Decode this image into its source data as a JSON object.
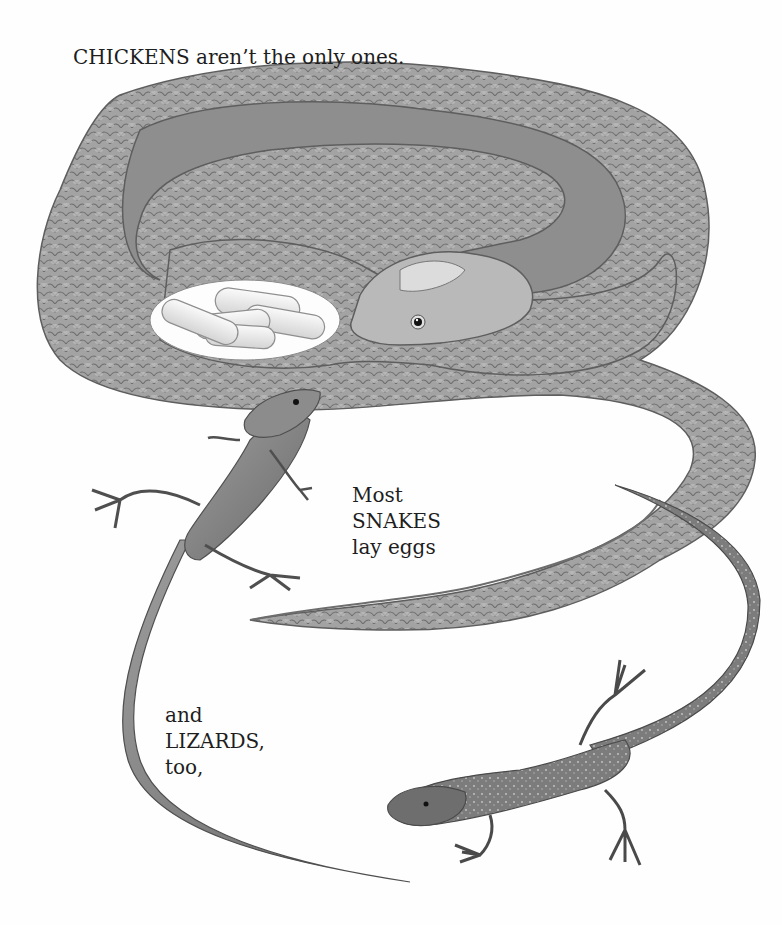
{
  "page": {
    "background": "#fefefe",
    "ink_color": "#1e1e1e"
  },
  "captions": {
    "top": "CHICKENS aren’t the only ones.",
    "snakes": {
      "lines": [
        "Most",
        "SNAKES",
        "lay eggs"
      ]
    },
    "lizards": {
      "lines": [
        "and",
        "LIZARDS,",
        "too,"
      ]
    }
  },
  "illustration": {
    "subjects": [
      "coiled-snake",
      "snake-eggs",
      "lizard-upper-left",
      "lizard-lower-right"
    ],
    "egg_count": 5,
    "palette": {
      "snake_scale": "#9a9a9a",
      "snake_shadow": "#6e6e6e",
      "snake_light": "#c8c8c8",
      "egg": "#ececec",
      "lizard": "#8a8a8a"
    }
  }
}
